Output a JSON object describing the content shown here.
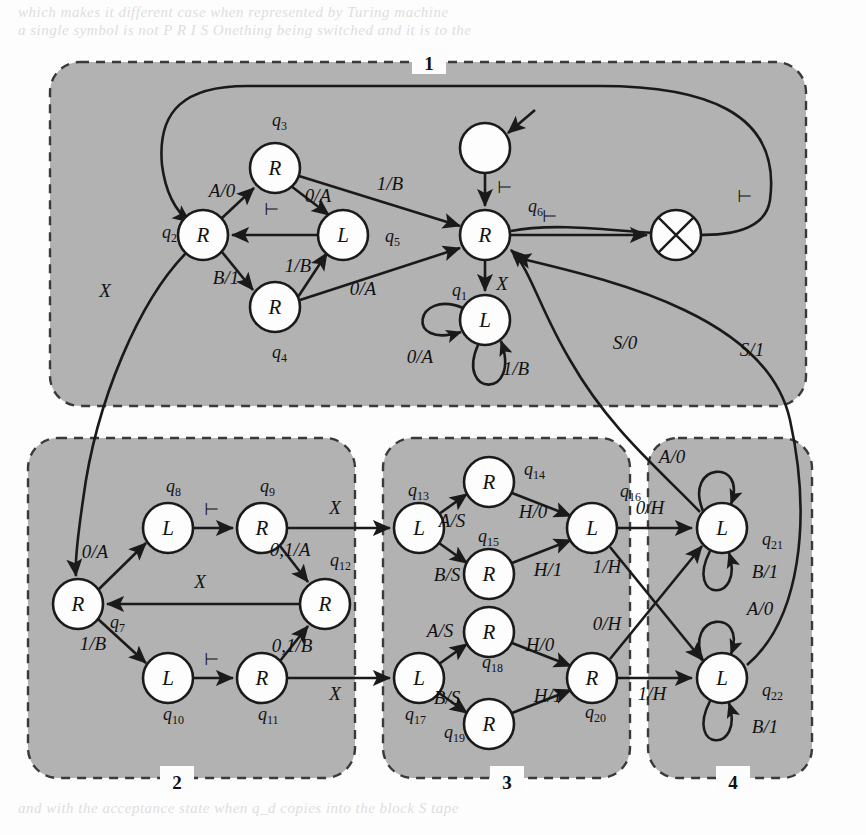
{
  "figure": {
    "kind": "state-transition-diagram",
    "background_color": "#fcfcfc",
    "group_fill": "#b2b2b2",
    "group_border": "#3a3a3a",
    "node_fill": "#fdfdfd",
    "node_stroke": "#1a1a1a",
    "edge_color": "#1a1a1a"
  },
  "groups": [
    {
      "id": "g1",
      "label": "1",
      "label_pos": "top",
      "x": 50,
      "y": 62,
      "w": 756,
      "h": 344
    },
    {
      "id": "g2",
      "label": "2",
      "label_pos": "bottom",
      "x": 28,
      "y": 438,
      "w": 327,
      "h": 340
    },
    {
      "id": "g3",
      "label": "3",
      "label_pos": "bottom",
      "x": 383,
      "y": 438,
      "w": 247,
      "h": 340
    },
    {
      "id": "g4",
      "label": "4",
      "label_pos": "bottom",
      "x": 648,
      "y": 438,
      "w": 164,
      "h": 340
    }
  ],
  "nodes": [
    {
      "id": "start",
      "label": "",
      "name": "q_start",
      "cx": 485,
      "cy": 148,
      "r": 25,
      "kind": "blank",
      "group": "g1"
    },
    {
      "id": "halt",
      "label": "",
      "name": "q_halt",
      "cx": 676,
      "cy": 235,
      "r": 25,
      "kind": "cross",
      "group": "g1"
    },
    {
      "id": "q6",
      "label": "R",
      "name": "q6",
      "cx": 485,
      "cy": 235,
      "r": 25,
      "kind": "state",
      "group": "g1"
    },
    {
      "id": "q3",
      "label": "R",
      "name": "q3",
      "cx": 275,
      "cy": 168,
      "r": 25,
      "kind": "state",
      "group": "g1"
    },
    {
      "id": "q2",
      "label": "R",
      "name": "q2",
      "cx": 203,
      "cy": 235,
      "r": 25,
      "kind": "state",
      "group": "g1"
    },
    {
      "id": "q5",
      "label": "L",
      "name": "q5",
      "cx": 343,
      "cy": 235,
      "r": 25,
      "kind": "state",
      "group": "g1"
    },
    {
      "id": "q4",
      "label": "R",
      "name": "q4",
      "cx": 275,
      "cy": 307,
      "r": 25,
      "kind": "state",
      "group": "g1"
    },
    {
      "id": "q1",
      "label": "L",
      "name": "q1",
      "cx": 485,
      "cy": 320,
      "r": 25,
      "kind": "state",
      "group": "g1"
    },
    {
      "id": "q7",
      "label": "R",
      "name": "q7",
      "cx": 78,
      "cy": 604,
      "r": 25,
      "kind": "state",
      "group": "g2"
    },
    {
      "id": "q8",
      "label": "L",
      "name": "q8",
      "cx": 168,
      "cy": 528,
      "r": 25,
      "kind": "state",
      "group": "g2"
    },
    {
      "id": "q9",
      "label": "R",
      "name": "q9",
      "cx": 262,
      "cy": 528,
      "r": 25,
      "kind": "state",
      "group": "g2"
    },
    {
      "id": "q10",
      "label": "L",
      "name": "q10",
      "cx": 168,
      "cy": 678,
      "r": 25,
      "kind": "state",
      "group": "g2"
    },
    {
      "id": "q11",
      "label": "R",
      "name": "q11",
      "cx": 262,
      "cy": 678,
      "r": 25,
      "kind": "state",
      "group": "g2"
    },
    {
      "id": "q12",
      "label": "R",
      "name": "q12",
      "cx": 325,
      "cy": 604,
      "r": 25,
      "kind": "state",
      "group": "g2"
    },
    {
      "id": "q13",
      "label": "L",
      "name": "q13",
      "cx": 419,
      "cy": 528,
      "r": 25,
      "kind": "state",
      "group": "g3"
    },
    {
      "id": "q14",
      "label": "R",
      "name": "q14",
      "cx": 489,
      "cy": 482,
      "r": 25,
      "kind": "state",
      "group": "g3"
    },
    {
      "id": "q15",
      "label": "R",
      "name": "q15",
      "cx": 489,
      "cy": 574,
      "r": 25,
      "kind": "state",
      "group": "g3"
    },
    {
      "id": "q16",
      "label": "L",
      "name": "q16",
      "cx": 592,
      "cy": 528,
      "r": 25,
      "kind": "state",
      "group": "g3"
    },
    {
      "id": "q17",
      "label": "L",
      "name": "q17",
      "cx": 419,
      "cy": 678,
      "r": 25,
      "kind": "state",
      "group": "g3"
    },
    {
      "id": "q18",
      "label": "R",
      "name": "q18",
      "cx": 489,
      "cy": 632,
      "r": 25,
      "kind": "state",
      "group": "g3"
    },
    {
      "id": "q19",
      "label": "R",
      "name": "q19",
      "cx": 489,
      "cy": 724,
      "r": 25,
      "kind": "state",
      "group": "g3"
    },
    {
      "id": "q20",
      "label": "R",
      "name": "q20",
      "cx": 592,
      "cy": 678,
      "r": 25,
      "kind": "state",
      "group": "g3"
    },
    {
      "id": "q21",
      "label": "L",
      "name": "q21",
      "cx": 722,
      "cy": 528,
      "r": 25,
      "kind": "state",
      "group": "g4"
    },
    {
      "id": "q22",
      "label": "L",
      "name": "q22",
      "cx": 722,
      "cy": 678,
      "r": 25,
      "kind": "state",
      "group": "g4"
    }
  ],
  "node_name_labels": [
    {
      "for": "q3",
      "text": "q",
      "sub": "3",
      "x": 272,
      "y": 126
    },
    {
      "for": "q2",
      "text": "q",
      "sub": "2",
      "x": 162,
      "y": 238
    },
    {
      "for": "q5",
      "text": "q",
      "sub": "5",
      "x": 385,
      "y": 242
    },
    {
      "for": "q4",
      "text": "q",
      "sub": "4",
      "x": 272,
      "y": 358
    },
    {
      "for": "q6",
      "text": "q",
      "sub": "6",
      "x": 528,
      "y": 212
    },
    {
      "for": "q1",
      "text": "q",
      "sub": "1",
      "x": 452,
      "y": 296
    },
    {
      "for": "q8",
      "text": "q",
      "sub": "8",
      "x": 166,
      "y": 492
    },
    {
      "for": "q9",
      "text": "q",
      "sub": "9",
      "x": 260,
      "y": 492
    },
    {
      "for": "q7",
      "text": "q",
      "sub": "7",
      "x": 110,
      "y": 628
    },
    {
      "for": "q10",
      "text": "q",
      "sub": "10",
      "x": 163,
      "y": 720
    },
    {
      "for": "q11",
      "text": "q",
      "sub": "11",
      "x": 258,
      "y": 720
    },
    {
      "for": "q12",
      "text": "q",
      "sub": "12",
      "x": 330,
      "y": 566
    },
    {
      "for": "q13",
      "text": "q",
      "sub": "13",
      "x": 408,
      "y": 496
    },
    {
      "for": "q14",
      "text": "q",
      "sub": "14",
      "x": 524,
      "y": 475
    },
    {
      "for": "q15",
      "text": "q",
      "sub": "15",
      "x": 478,
      "y": 542
    },
    {
      "for": "q16",
      "text": "q",
      "sub": "16",
      "x": 620,
      "y": 497
    },
    {
      "for": "q17",
      "text": "q",
      "sub": "17",
      "x": 405,
      "y": 720
    },
    {
      "for": "q18",
      "text": "q",
      "sub": "18",
      "x": 482,
      "y": 668
    },
    {
      "for": "q19",
      "text": "q",
      "sub": "19",
      "x": 444,
      "y": 738
    },
    {
      "for": "q20",
      "text": "q",
      "sub": "20",
      "x": 585,
      "y": 718
    },
    {
      "for": "q21",
      "text": "q",
      "sub": "21",
      "x": 762,
      "y": 545
    },
    {
      "for": "q22",
      "text": "q",
      "sub": "22",
      "x": 762,
      "y": 696
    }
  ],
  "edges": [
    {
      "id": "e-start-q6",
      "from": "start",
      "to": "q6",
      "label": "⊢",
      "label_x": 505,
      "label_y": 193,
      "kind": "straight"
    },
    {
      "id": "e-q6-halt",
      "from": "q6",
      "to": "halt",
      "label": "⊢",
      "label_x": 550,
      "label_y": 222,
      "kind": "straight"
    },
    {
      "id": "e-q6-q1",
      "from": "q6",
      "to": "q1",
      "label": "X",
      "label_x": 502,
      "label_y": 290,
      "kind": "straight"
    },
    {
      "id": "e-q1-q1-a",
      "from": "q1",
      "to": "q1",
      "label": "0/A",
      "label_x": 420,
      "label_y": 363,
      "kind": "self-loop-left"
    },
    {
      "id": "e-q1-q1-b",
      "from": "q1",
      "to": "q1",
      "label": "1/B",
      "label_x": 516,
      "label_y": 375,
      "kind": "self-loop-down"
    },
    {
      "id": "e-bigloop",
      "from": "q6",
      "to": "q2",
      "label": "⊢",
      "label_x": 745,
      "label_y": 202,
      "kind": "big-loop-top"
    },
    {
      "id": "e-q2-q3",
      "from": "q2",
      "to": "q3",
      "label": "A/0",
      "label_x": 222,
      "label_y": 197,
      "kind": "straight"
    },
    {
      "id": "e-q2-q4",
      "from": "q2",
      "to": "q4",
      "label": "B/1",
      "label_x": 226,
      "label_y": 284,
      "kind": "straight"
    },
    {
      "id": "e-q3-q5",
      "from": "q3",
      "to": "q5",
      "label": "0/A",
      "label_x": 318,
      "label_y": 202,
      "kind": "straight"
    },
    {
      "id": "e-q3-q6",
      "from": "q3",
      "to": "q6",
      "label": "1/B",
      "label_x": 390,
      "label_y": 190,
      "kind": "straight"
    },
    {
      "id": "e-q4-q5",
      "from": "q4",
      "to": "q5",
      "label": "1/B",
      "label_x": 298,
      "label_y": 272,
      "kind": "straight"
    },
    {
      "id": "e-q4-q6",
      "from": "q4",
      "to": "q6",
      "label": "0/A",
      "label_x": 363,
      "label_y": 295,
      "kind": "straight"
    },
    {
      "id": "e-q5-q2",
      "from": "q5",
      "to": "q2",
      "label": "⊢",
      "label_x": 272,
      "label_y": 215,
      "kind": "straight"
    },
    {
      "id": "e-q2-q7",
      "from": "q2",
      "to": "q7",
      "label": "X",
      "label_x": 105,
      "label_y": 297,
      "kind": "curve-down-left"
    },
    {
      "id": "e-q7-q8",
      "from": "q7",
      "to": "q8",
      "label": "0/A",
      "label_x": 95,
      "label_y": 558,
      "kind": "straight"
    },
    {
      "id": "e-q7-q10",
      "from": "q7",
      "to": "q10",
      "label": "1/B",
      "label_x": 93,
      "label_y": 650,
      "kind": "straight"
    },
    {
      "id": "e-q8-q9",
      "from": "q8",
      "to": "q9",
      "label": "⊢",
      "label_x": 212,
      "label_y": 515,
      "kind": "straight"
    },
    {
      "id": "e-q10-q11",
      "from": "q10",
      "to": "q11",
      "label": "⊢",
      "label_x": 212,
      "label_y": 665,
      "kind": "straight"
    },
    {
      "id": "e-q9-q12",
      "from": "q9",
      "to": "q12",
      "label": "0,1/A",
      "label_x": 290,
      "label_y": 556,
      "kind": "straight"
    },
    {
      "id": "e-q11-q12",
      "from": "q11",
      "to": "q12",
      "label": "0,1/B",
      "label_x": 292,
      "label_y": 652,
      "kind": "straight"
    },
    {
      "id": "e-q12-q7",
      "from": "q12",
      "to": "q7",
      "label": "X",
      "label_x": 200,
      "label_y": 588,
      "kind": "straight"
    },
    {
      "id": "e-q9-q13",
      "from": "q9",
      "to": "q13",
      "label": "X",
      "label_x": 335,
      "label_y": 514,
      "kind": "straight"
    },
    {
      "id": "e-q11-q17",
      "from": "q11",
      "to": "q17",
      "label": "X",
      "label_x": 335,
      "label_y": 700,
      "kind": "straight"
    },
    {
      "id": "e-q13-q14",
      "from": "q13",
      "to": "q14",
      "label": "A/S",
      "label_x": 452,
      "label_y": 527,
      "kind": "straight"
    },
    {
      "id": "e-q13-q15",
      "from": "q13",
      "to": "q15",
      "label": "B/S",
      "label_x": 447,
      "label_y": 581,
      "kind": "straight"
    },
    {
      "id": "e-q14-q16",
      "from": "q14",
      "to": "q16",
      "label": "H/0",
      "label_x": 533,
      "label_y": 518,
      "kind": "straight"
    },
    {
      "id": "e-q15-q16",
      "from": "q15",
      "to": "q16",
      "label": "H/1",
      "label_x": 548,
      "label_y": 576,
      "kind": "straight"
    },
    {
      "id": "e-q17-q18",
      "from": "q17",
      "to": "q18",
      "label": "A/S",
      "label_x": 440,
      "label_y": 637,
      "kind": "straight"
    },
    {
      "id": "e-q17-q19",
      "from": "q17",
      "to": "q19",
      "label": "B/S",
      "label_x": 447,
      "label_y": 704,
      "kind": "straight"
    },
    {
      "id": "e-q18-q20",
      "from": "q18",
      "to": "q20",
      "label": "H/0",
      "label_x": 540,
      "label_y": 651,
      "kind": "straight"
    },
    {
      "id": "e-q19-q20",
      "from": "q19",
      "to": "q20",
      "label": "H/1",
      "label_x": 548,
      "label_y": 702,
      "kind": "straight"
    },
    {
      "id": "e-q16-q21",
      "from": "q16",
      "to": "q21",
      "label": "0/H",
      "label_x": 650,
      "label_y": 514
    },
    {
      "id": "e-q16-q22",
      "from": "q16",
      "to": "q22",
      "label": "1/H",
      "label_x": 607,
      "label_y": 573
    },
    {
      "id": "e-q20-q21",
      "from": "q20",
      "to": "q21",
      "label": "0/H",
      "label_x": 607,
      "label_y": 630
    },
    {
      "id": "e-q20-q22",
      "from": "q20",
      "to": "q22",
      "label": "1/H",
      "label_x": 652,
      "label_y": 700
    },
    {
      "id": "e-q21-q21-a",
      "from": "q21",
      "to": "q21",
      "label": "A/0",
      "label_x": 672,
      "label_y": 463,
      "kind": "self-loop-up"
    },
    {
      "id": "e-q21-q21-b",
      "from": "q21",
      "to": "q21",
      "label": "B/1",
      "label_x": 765,
      "label_y": 578,
      "kind": "self-loop-down"
    },
    {
      "id": "e-q22-q22-a",
      "from": "q22",
      "to": "q22",
      "label": "A/0",
      "label_x": 760,
      "label_y": 615,
      "kind": "self-loop-up"
    },
    {
      "id": "e-q22-q22-b",
      "from": "q22",
      "to": "q22",
      "label": "B/1",
      "label_x": 765,
      "label_y": 733,
      "kind": "self-loop-down"
    },
    {
      "id": "e-q21-q6",
      "from": "q21",
      "to": "q6",
      "label": "S/0",
      "label_x": 625,
      "label_y": 349,
      "kind": "long-curve"
    },
    {
      "id": "e-q22-q6",
      "from": "q22",
      "to": "q6",
      "label": "S/1",
      "label_x": 752,
      "label_y": 356,
      "kind": "long-curve"
    }
  ],
  "bleed_text": [
    {
      "text": "which makes it different case when represented by Turing machine",
      "x": 18,
      "y": 4
    },
    {
      "text": "a single symbol is not P R I S Onething being switched and it is to the",
      "x": 18,
      "y": 22
    },
    {
      "text": "and with the acceptance state when q_d copies into the block S tape",
      "x": 18,
      "y": 800
    }
  ]
}
